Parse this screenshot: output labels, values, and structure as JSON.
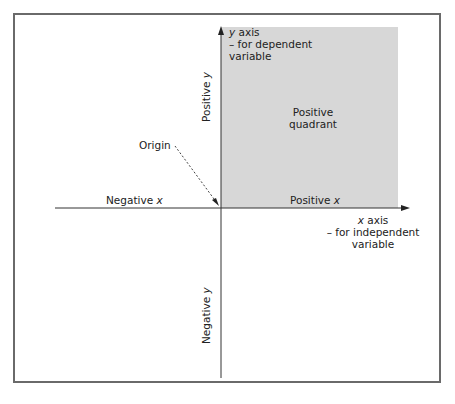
{
  "diagram": {
    "colors": {
      "quadrant_fill": "#d7d7d7",
      "axis_line": "#333333",
      "frame_border": "#6a6a6a"
    },
    "labels": {
      "y_axis_line1_var": "y",
      "y_axis_line1_rest": " axis",
      "y_axis_line2": "– for dependent",
      "y_axis_line3": "variable",
      "x_axis_line1_var": "x",
      "x_axis_line1_rest": " axis",
      "x_axis_line2": "– for independent",
      "x_axis_line3": "variable",
      "positive_y_text": "Positive ",
      "positive_y_var": "y",
      "negative_y_text": "Negative ",
      "negative_y_var": "y",
      "positive_x_text": "Positive ",
      "positive_x_var": "x",
      "negative_x_text": "Negative ",
      "negative_x_var": "x",
      "quadrant_line1": "Positive",
      "quadrant_line2": "quadrant",
      "origin": "Origin"
    }
  }
}
